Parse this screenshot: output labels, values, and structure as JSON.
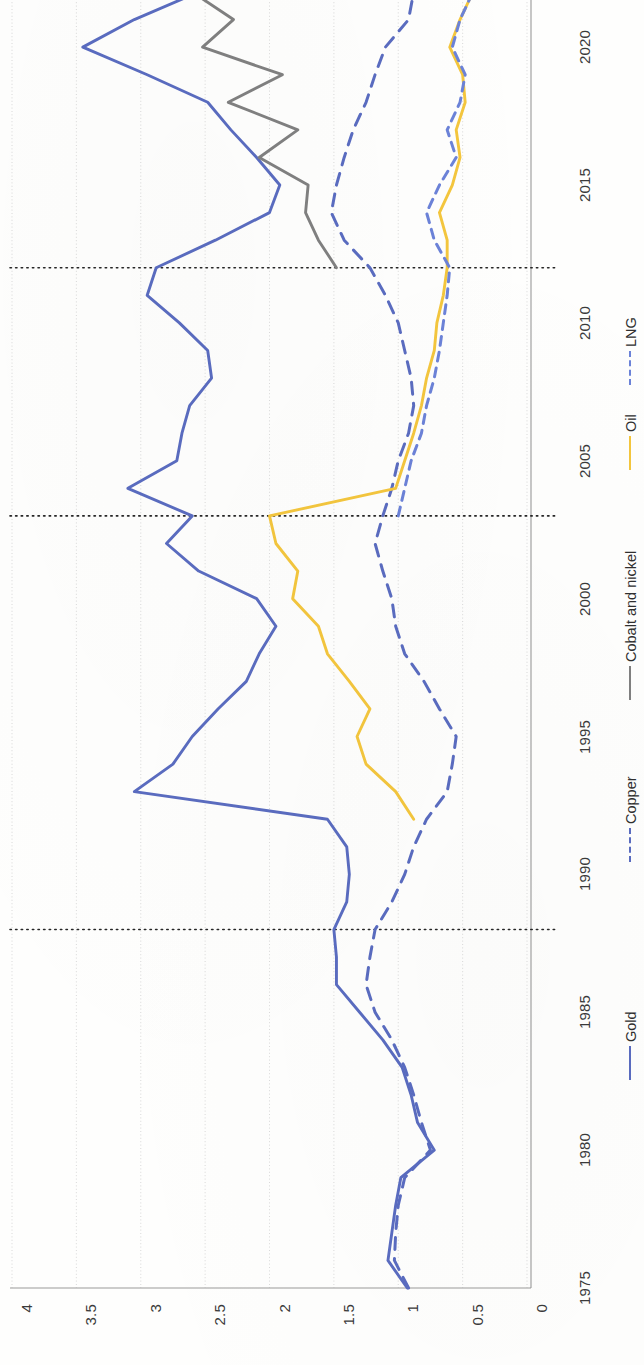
{
  "chart_data": {
    "type": "line",
    "title": "",
    "orientation": "rotated-90",
    "xlabel": "",
    "ylabel": "",
    "value_axis": {
      "position": "bottom",
      "inverted": true,
      "ticks": [
        "4",
        "3.5",
        "3",
        "2.5",
        "2",
        "1.5",
        "1",
        "0.5",
        "0"
      ],
      "tick_values": [
        4,
        3.5,
        3,
        2.5,
        2,
        1.5,
        1,
        0.5,
        0
      ],
      "lim": [
        0,
        4
      ]
    },
    "year_axis": {
      "position": "right",
      "ticks": [
        "1975",
        "1980",
        "1985",
        "1990",
        "1995",
        "2000",
        "2005",
        "2010",
        "2015",
        "2020"
      ],
      "tick_values": [
        1975,
        1980,
        1985,
        1990,
        1995,
        2000,
        2005,
        2010,
        2015,
        2020
      ],
      "lim": [
        1975,
        2022
      ]
    },
    "grid": "vertical-value-gridlines",
    "reference_lines": [
      1988,
      2003,
      2012
    ],
    "legend": {
      "position": "bottom-right-rotated",
      "entries": [
        {
          "name": "Gold",
          "color": "#5a6cc0",
          "style": "solid"
        },
        {
          "name": "Copper",
          "color": "#5a6cc0",
          "style": "dashed"
        },
        {
          "name": "Cobalt and nickel",
          "color": "#808080",
          "style": "solid"
        },
        {
          "name": "Oil",
          "color": "#f4c63d",
          "style": "solid"
        },
        {
          "name": "LNG",
          "color": "#6b82d8",
          "style": "dashed"
        }
      ]
    },
    "series": [
      {
        "name": "Gold",
        "color": "#5a6cc0",
        "style": "solid",
        "x": [
          1975,
          1976,
          1977,
          1978,
          1979,
          1980,
          1981,
          1982,
          1983,
          1984,
          1985,
          1986,
          1987,
          1988,
          1989,
          1990,
          1991,
          1992,
          1993,
          1994,
          1995,
          1996,
          1997,
          1998,
          1999,
          2000,
          2001,
          2002,
          2003,
          2004,
          2005,
          2006,
          2007,
          2008,
          2009,
          2010,
          2011,
          2012,
          2013,
          2014,
          2015,
          2016,
          2017,
          2018,
          2019,
          2020,
          2021,
          2022
        ],
        "values": [
          0.93,
          1.08,
          1.05,
          1.02,
          0.98,
          0.72,
          0.85,
          0.9,
          0.97,
          1.12,
          1.3,
          1.48,
          1.48,
          1.5,
          1.4,
          1.38,
          1.4,
          1.55,
          3.05,
          2.75,
          2.6,
          2.4,
          2.18,
          2.08,
          1.95,
          2.1,
          2.55,
          2.8,
          2.6,
          3.1,
          2.72,
          2.68,
          2.62,
          2.45,
          2.48,
          2.7,
          2.95,
          2.88,
          2.42,
          2.0,
          1.92,
          2.1,
          2.3,
          2.48,
          2.95,
          3.45,
          3.05,
          2.55
        ]
      },
      {
        "name": "Copper",
        "color": "#5a6cc0",
        "style": "dashed",
        "x": [
          1975,
          1976,
          1977,
          1978,
          1979,
          1980,
          1981,
          1982,
          1983,
          1984,
          1985,
          1986,
          1987,
          1988,
          1989,
          1990,
          1991,
          1992,
          1993,
          1994,
          1995,
          1996,
          1997,
          1998,
          1999,
          2000,
          2001,
          2002,
          2003,
          2004,
          2005,
          2006,
          2007,
          2008,
          2009,
          2010,
          2011,
          2012,
          2013,
          2014,
          2015,
          2016,
          2017,
          2018,
          2019,
          2020,
          2021,
          2022
        ],
        "values": [
          0.92,
          1.03,
          1.02,
          1.0,
          0.95,
          0.75,
          0.82,
          0.88,
          0.95,
          1.05,
          1.18,
          1.25,
          1.22,
          1.18,
          1.05,
          0.95,
          0.88,
          0.78,
          0.62,
          0.58,
          0.55,
          0.68,
          0.8,
          0.95,
          1.02,
          1.05,
          1.12,
          1.18,
          1.12,
          1.05,
          1.0,
          0.92,
          0.88,
          0.9,
          0.95,
          1.0,
          1.1,
          1.22,
          1.42,
          1.52,
          1.48,
          1.42,
          1.35,
          1.25,
          1.18,
          1.1,
          0.92,
          0.88
        ]
      },
      {
        "name": "Cobalt and nickel",
        "color": "#808080",
        "style": "solid",
        "x": [
          2012,
          2013,
          2014,
          2015,
          2016,
          2017,
          2018,
          2019,
          2020,
          2021,
          2022
        ],
        "values": [
          1.48,
          1.62,
          1.72,
          1.7,
          2.08,
          1.78,
          2.32,
          1.9,
          2.52,
          2.28,
          2.6
        ]
      },
      {
        "name": "Oil",
        "color": "#f4c63d",
        "style": "solid",
        "x": [
          1992,
          1993,
          1994,
          1995,
          1996,
          1997,
          1998,
          1999,
          2000,
          2001,
          2002,
          2003,
          2004,
          2005,
          2006,
          2007,
          2008,
          2009,
          2010,
          2011,
          2012,
          2013,
          2014,
          2015,
          2016,
          2017,
          2018,
          2019,
          2020,
          2021,
          2022
        ],
        "values": [
          0.88,
          1.02,
          1.25,
          1.32,
          1.22,
          1.38,
          1.55,
          1.62,
          1.82,
          1.78,
          1.95,
          2.0,
          1.02,
          0.95,
          0.88,
          0.82,
          0.78,
          0.72,
          0.7,
          0.65,
          0.62,
          0.62,
          0.68,
          0.58,
          0.52,
          0.55,
          0.48,
          0.5,
          0.6,
          0.52,
          0.42
        ]
      },
      {
        "name": "LNG",
        "color": "#6b82d8",
        "style": "dashed",
        "x": [
          2003,
          2004,
          2005,
          2006,
          2007,
          2008,
          2009,
          2010,
          2011,
          2012,
          2013,
          2014,
          2015,
          2016,
          2017,
          2018,
          2019,
          2020,
          2021,
          2022
        ],
        "values": [
          1.0,
          0.95,
          0.9,
          0.82,
          0.78,
          0.72,
          0.68,
          0.65,
          0.62,
          0.6,
          0.72,
          0.78,
          0.68,
          0.55,
          0.62,
          0.52,
          0.48,
          0.58,
          0.52,
          0.42
        ]
      }
    ]
  }
}
